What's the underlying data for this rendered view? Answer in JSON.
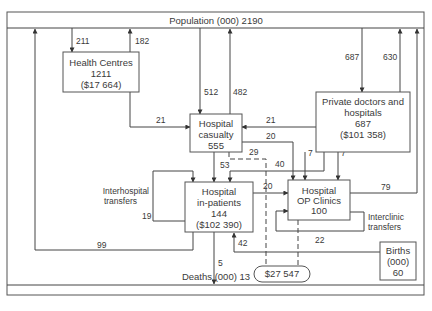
{
  "diagram": {
    "top_band": "Population (000) 2190",
    "bottom_band": "Deaths (000) 13",
    "nodes": {
      "health_centres": {
        "name": "Health Centres",
        "count": "1211",
        "cost": "($17 664)"
      },
      "casualty": {
        "name_line1": "Hospital",
        "name_line2": "casualty",
        "count": "555"
      },
      "private": {
        "name_line1": "Private doctors and",
        "name_line2": "hospitals",
        "count": "687",
        "cost": "($101 358)"
      },
      "inpatients": {
        "name_line1": "Hospital",
        "name_line2": "in-patients",
        "count": "144",
        "cost": "($102 390)"
      },
      "op_clinics": {
        "name_line1": "Hospital",
        "name_line2": "OP Clinics",
        "count": "100"
      },
      "births": {
        "line1": "Births",
        "line2": "(000)",
        "count": "60"
      },
      "outpatient_cost": {
        "value": "$27 547"
      }
    },
    "annotations": {
      "interhospital_1": "Interhospital",
      "interhospital_2": "transfers",
      "interclinic_1": "Interclinic",
      "interclinic_2": "transfers"
    },
    "flows": {
      "pop_to_hc": "211",
      "hc_to_pop": "182",
      "pop_to_cas": "512",
      "cas_to_pop": "482",
      "pop_to_private": "687",
      "private_to_pop": "630",
      "hc_to_cas": "21",
      "private_to_cas": "21",
      "cas_to_op": "20",
      "cas_to_inp": "53",
      "cas_dashed": "29",
      "private_to_inp": "40",
      "private_to_op_a": "7",
      "private_to_op_b": "7",
      "inp_to_op": "20",
      "op_to_pop": "79",
      "interhospital": "19",
      "inp_to_pop": "99",
      "interclinic": "22",
      "births_to_inp": "42",
      "inp_to_deaths": "5"
    }
  }
}
